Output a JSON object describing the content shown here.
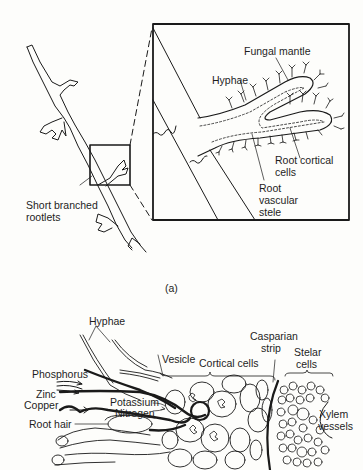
{
  "panel_a": {
    "caption": "(a)",
    "labels": {
      "short_branched_rootlets_1": "Short branched",
      "short_branched_rootlets_2": "rootlets",
      "fungal_mantle": "Fungal mantle",
      "hyphae": "Hyphae",
      "root_cortical_cells_1": "Root  cortical",
      "root_cortical_cells_2": "cells",
      "root_vascular_stele_1": "Root",
      "root_vascular_stele_2": "vascular",
      "root_vascular_stele_3": "stele"
    }
  },
  "panel_b": {
    "labels": {
      "hyphae": "Hyphae",
      "phosphorus": "Phosphorus",
      "zinc": "Zinc",
      "copper": "Copper",
      "potassium": "Potassium",
      "nitrogen": "Nitrogen",
      "root_hair": "Root hair",
      "vesicle": "Vesicle",
      "cortical_cells": "Cortical cells",
      "casparian_strip_1": "Casparian",
      "casparian_strip_2": "strip",
      "stelar_cells_1": "Stelar",
      "stelar_cells_2": "cells",
      "xylem_vessels_1": "Xylem",
      "xylem_vessels_2": "vessels"
    }
  },
  "colors": {
    "ink": "#1a1a1a",
    "paper": "#fdfdfb"
  }
}
